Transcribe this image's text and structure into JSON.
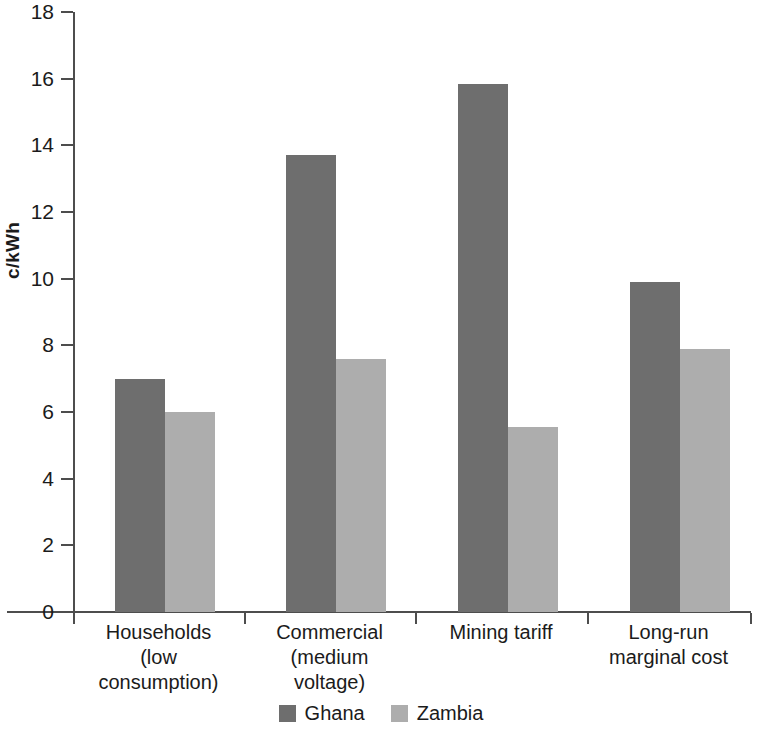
{
  "chart_data": {
    "type": "bar",
    "title": "",
    "xlabel": "",
    "ylabel": "c/kWh",
    "ylim": [
      0,
      18
    ],
    "ytick_step": 2,
    "yticks": [
      18,
      16,
      14,
      12,
      10,
      8,
      6,
      4,
      2,
      0
    ],
    "grid": false,
    "legend_position": "bottom-center",
    "categories": [
      "Households\n(low\nconsumption)",
      "Commercial\n(medium\nvoltage)",
      "Mining tariff",
      "Long-run\nmarginal cost"
    ],
    "category_lines": [
      [
        "Households",
        "(low",
        "consumption)"
      ],
      [
        "Commercial",
        "(medium",
        "voltage)"
      ],
      [
        "Mining tariff"
      ],
      [
        "Long-run",
        "marginal cost"
      ]
    ],
    "series": [
      {
        "name": "Ghana",
        "color": "#6e6e6e",
        "values": [
          7.0,
          13.7,
          15.85,
          9.9
        ]
      },
      {
        "name": "Zambia",
        "color": "#adadad",
        "values": [
          6.0,
          7.6,
          5.55,
          7.9
        ]
      }
    ],
    "legend": [
      {
        "label": "Ghana",
        "color": "#6e6e6e"
      },
      {
        "label": "Zambia",
        "color": "#adadad"
      }
    ]
  }
}
